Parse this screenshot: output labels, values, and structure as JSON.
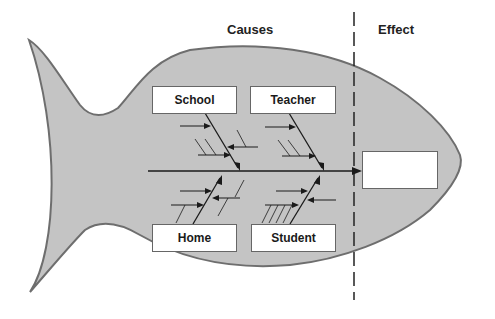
{
  "diagram": {
    "type": "fishbone",
    "headers": {
      "causes": "Causes",
      "effect": "Effect"
    },
    "categories": [
      {
        "id": "school",
        "label": "School",
        "position": "top"
      },
      {
        "id": "teacher",
        "label": "Teacher",
        "position": "top"
      },
      {
        "id": "home",
        "label": "Home",
        "position": "bottom"
      },
      {
        "id": "student",
        "label": "Student",
        "position": "bottom"
      }
    ],
    "effect_box": {
      "label": ""
    },
    "colors": {
      "fish_fill": "#c4c4c4",
      "fish_outline": "#6e6e6e",
      "line": "#1a1a1a",
      "box_fill": "#ffffff"
    }
  }
}
